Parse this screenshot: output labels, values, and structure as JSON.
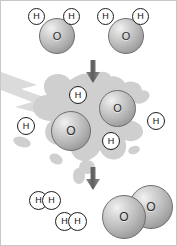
{
  "diagram": {
    "title": "Water dissociation into hydrogen and oxygen",
    "background_color": "#ffffff",
    "border_color": "#c8c8c8",
    "atom_colors": {
      "oxygen_fill": "#c3c3c3",
      "oxygen_outline": "#6e6e6e",
      "hydrogen_fill": "#ffffff",
      "hydrogen_outline": "#1d1d1d",
      "splash": "#cfcfcf",
      "arrow": "#6b6b6b"
    },
    "stages": [
      {
        "id": "reactants",
        "name": "water-molecules",
        "caption": "Two water molecules",
        "molecules": [
          {
            "formula": "H2O",
            "atoms": [
              {
                "symbol": "O",
                "x": 38,
                "y": 17,
                "size": 36
              },
              {
                "symbol": "H",
                "x": 27,
                "y": 7,
                "size": 17
              },
              {
                "symbol": "H",
                "x": 62,
                "y": 7,
                "size": 17
              }
            ]
          },
          {
            "formula": "H2O",
            "atoms": [
              {
                "symbol": "O",
                "x": 107,
                "y": 17,
                "size": 36
              },
              {
                "symbol": "H",
                "x": 96,
                "y": 7,
                "size": 17
              },
              {
                "symbol": "H",
                "x": 131,
                "y": 7,
                "size": 17
              }
            ]
          }
        ]
      },
      {
        "id": "dissociation",
        "name": "energy-splash-dissociation",
        "caption": "Energy splits the molecules into free atoms",
        "molecules": [
          {
            "formula": "O",
            "atoms": [
              {
                "symbol": "O",
                "x": 50,
                "y": 110,
                "size": 40
              }
            ]
          },
          {
            "formula": "O",
            "atoms": [
              {
                "symbol": "O",
                "x": 98,
                "y": 89,
                "size": 37
              }
            ]
          },
          {
            "formula": "H",
            "atoms": [
              {
                "symbol": "H",
                "x": 68,
                "y": 85,
                "size": 18
              }
            ]
          },
          {
            "formula": "H",
            "atoms": [
              {
                "symbol": "H",
                "x": 16,
                "y": 116,
                "size": 18
              }
            ]
          },
          {
            "formula": "H",
            "atoms": [
              {
                "symbol": "H",
                "x": 146,
                "y": 111,
                "size": 18
              }
            ]
          },
          {
            "formula": "H",
            "atoms": [
              {
                "symbol": "H",
                "x": 101,
                "y": 131,
                "size": 18
              }
            ]
          }
        ]
      },
      {
        "id": "products",
        "name": "hydrogen-and-oxygen-molecules",
        "caption": "Two hydrogen molecules and one oxygen molecule",
        "molecules": [
          {
            "formula": "H2",
            "atoms": [
              {
                "symbol": "H",
                "x": 28,
                "y": 190,
                "size": 19
              },
              {
                "symbol": "H",
                "x": 41,
                "y": 190,
                "size": 19
              }
            ]
          },
          {
            "formula": "H2",
            "atoms": [
              {
                "symbol": "H",
                "x": 54,
                "y": 211,
                "size": 19
              },
              {
                "symbol": "H",
                "x": 67,
                "y": 211,
                "size": 19
              }
            ]
          },
          {
            "formula": "O2",
            "atoms": [
              {
                "symbol": "O",
                "x": 101,
                "y": 194,
                "size": 44
              },
              {
                "symbol": "O",
                "x": 128,
                "y": 184,
                "size": 44
              }
            ]
          }
        ]
      }
    ],
    "arrows": [
      {
        "id": "arrow-1",
        "name": "arrow-reactants-to-dissociation",
        "direction": "down",
        "x": 85,
        "y": 59,
        "width": 14,
        "height": 23
      },
      {
        "id": "arrow-2",
        "name": "arrow-dissociation-to-products",
        "direction": "down",
        "x": 85,
        "y": 166,
        "width": 14,
        "height": 23
      }
    ],
    "splash": {
      "name": "energy-splash",
      "description": "Grey irregular splash with a lightning bolt entering from the left",
      "color": "#cfcfcf"
    },
    "symbols": {
      "oxygen": "O",
      "hydrogen": "H"
    }
  }
}
